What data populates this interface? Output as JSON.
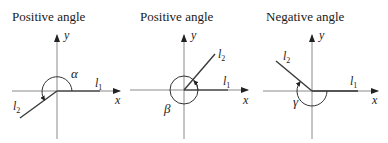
{
  "panels": [
    {
      "title": "Positive angle",
      "axis_x_label": "x",
      "axis_y_label": "y",
      "line1_label": "l",
      "line1_sub": "1",
      "line2_label": "l",
      "line2_sub": "2",
      "angle_label": "α",
      "direction": "counterclockwise"
    },
    {
      "title": "Positive angle",
      "axis_x_label": "x",
      "axis_y_label": "y",
      "line1_label": "l",
      "line1_sub": "1",
      "line2_label": "l",
      "line2_sub": "2",
      "angle_label": "β",
      "direction": "counterclockwise (more than full turn)"
    },
    {
      "title": "Negative angle",
      "axis_x_label": "x",
      "axis_y_label": "y",
      "line1_label": "l",
      "line1_sub": "1",
      "line2_label": "l",
      "line2_sub": "2",
      "angle_label": "γ",
      "direction": "clockwise"
    }
  ],
  "colors": {
    "axis": "#8a8a8a",
    "line": "#3a3a3a",
    "text": "#1a1a1a"
  }
}
